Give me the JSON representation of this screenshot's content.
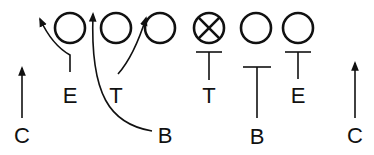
{
  "diagram": {
    "type": "football-play",
    "colors": {
      "ink": "#111111",
      "background": "#ffffff"
    },
    "offense": [
      {
        "id": "o1",
        "symbol": "circle",
        "cx": 70,
        "cy": 28
      },
      {
        "id": "o2",
        "symbol": "circle",
        "cx": 116,
        "cy": 28
      },
      {
        "id": "o3",
        "symbol": "circle",
        "cx": 160,
        "cy": 28
      },
      {
        "id": "o4",
        "symbol": "circle-x",
        "cx": 209,
        "cy": 28
      },
      {
        "id": "o5",
        "symbol": "circle",
        "cx": 256,
        "cy": 28
      },
      {
        "id": "o6",
        "symbol": "circle",
        "cx": 298,
        "cy": 28
      }
    ],
    "defense_labels": {
      "left_c": "C",
      "left_e": "E",
      "left_t": "T",
      "left_b": "B",
      "right_t": "T",
      "right_b": "B",
      "right_e": "E",
      "right_c": "C"
    },
    "assignments": [
      {
        "from": "left_c",
        "action": "arrow-up"
      },
      {
        "from": "left_e",
        "action": "arrow-curve-outside"
      },
      {
        "from": "left_t",
        "action": "arrow-curve-inside"
      },
      {
        "from": "left_b",
        "action": "arrow-curve-long"
      },
      {
        "from": "right_t",
        "action": "block"
      },
      {
        "from": "right_b",
        "action": "block"
      },
      {
        "from": "right_e",
        "action": "block"
      },
      {
        "from": "right_c",
        "action": "arrow-up"
      }
    ]
  }
}
